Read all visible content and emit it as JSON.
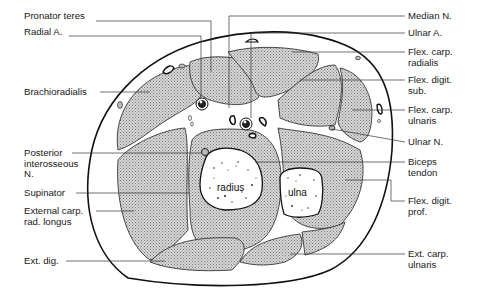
{
  "diagram": {
    "left_labels": [
      {
        "id": "pronator-teres",
        "text": "Pronator teres",
        "x": 24,
        "y": 16
      },
      {
        "id": "radial-a",
        "text": "Radial A.",
        "x": 24,
        "y": 31
      },
      {
        "id": "brachioradialis",
        "text": "Brachioradialis",
        "x": 24,
        "y": 87
      },
      {
        "id": "posterior-interosseous-n",
        "text": "Posterior\ninterosseous\nN.",
        "x": 24,
        "y": 148
      },
      {
        "id": "supinator",
        "text": "Supinator",
        "x": 24,
        "y": 187
      },
      {
        "id": "external-carp-rad-longus",
        "text": "External carp.\nrad. longus",
        "x": 24,
        "y": 205
      },
      {
        "id": "ext-dig",
        "text": "Ext. dig.",
        "x": 24,
        "y": 256
      }
    ],
    "right_labels": [
      {
        "id": "median-n",
        "text": "Median N.",
        "x": 408,
        "y": 11
      },
      {
        "id": "ulnar-a",
        "text": "Ulnar A.",
        "x": 408,
        "y": 28
      },
      {
        "id": "flex-carp-radialis",
        "text": "Flex. carp.\nradialis",
        "x": 408,
        "y": 47
      },
      {
        "id": "flex-digit-sub",
        "text": "Flex. digit.\nsub.",
        "x": 408,
        "y": 75
      },
      {
        "id": "flex-carp-ulnaris",
        "text": "Flex. carp.\nulnaris",
        "x": 408,
        "y": 105
      },
      {
        "id": "ulnar-n",
        "text": "Ulnar N.",
        "x": 408,
        "y": 137
      },
      {
        "id": "biceps-tendon",
        "text": "Biceps\ntendon",
        "x": 408,
        "y": 157
      },
      {
        "id": "flex-digit-prof",
        "text": "Flex. digit.\nprof.",
        "x": 408,
        "y": 196
      },
      {
        "id": "ext-carp-ulnaris",
        "text": "Ext. carp.\nulnaris",
        "x": 408,
        "y": 249
      }
    ],
    "bones": [
      {
        "id": "radius",
        "text": "radius"
      },
      {
        "id": "ulna",
        "text": "ulna"
      }
    ],
    "colors": {
      "outline": "#111111",
      "muscle_fill": "#bdbdbd",
      "leader_line": "#333333",
      "background": "#ffffff"
    }
  }
}
